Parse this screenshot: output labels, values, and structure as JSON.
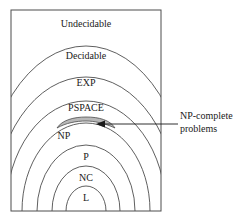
{
  "figure": {
    "border_color": "#4d4d4d",
    "arc_color": "#4d4d4d",
    "text_color": "#1a1a1a",
    "background": "#ffffff",
    "highlight_fill": "#b8b8b8"
  },
  "regions": [
    {
      "key": "undecidable",
      "label": "Undecidable",
      "font_size": 10,
      "x": 86,
      "y": 24
    },
    {
      "key": "decidable",
      "label": "Decidable",
      "font_size": 10,
      "x": 86,
      "y": 56
    },
    {
      "key": "exp",
      "label": "EXP",
      "font_size": 10,
      "x": 86,
      "y": 83
    },
    {
      "key": "pspace",
      "label": "PSPACE",
      "font_size": 10,
      "x": 86,
      "y": 108
    },
    {
      "key": "np",
      "label": "NP",
      "font_size": 10,
      "x": 64,
      "y": 136
    },
    {
      "key": "p",
      "label": "P",
      "font_size": 10,
      "x": 86,
      "y": 157
    },
    {
      "key": "nc",
      "label": "NC",
      "font_size": 10,
      "x": 86,
      "y": 178
    },
    {
      "key": "l",
      "label": "L",
      "font_size": 10,
      "x": 86,
      "y": 198
    }
  ],
  "annotation": {
    "key": "np-complete",
    "line1": "NP-complete",
    "line2": "problems",
    "arrow_from_x": 178,
    "arrow_to_x": 98,
    "arrow_y": 124
  }
}
